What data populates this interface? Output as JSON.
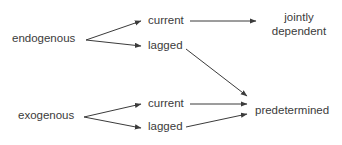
{
  "diagram": {
    "type": "flow-diagram",
    "background_color": "#ffffff",
    "ink_color": "#3b3b3b",
    "nodes": {
      "endogenous": "endogenous",
      "exogenous": "exogenous",
      "endogenous_current": "current",
      "endogenous_lagged": "lagged",
      "exogenous_current": "current",
      "exogenous_lagged": "lagged",
      "jointly_dependent": "jointly\ndependent",
      "predetermined": "predetermined"
    },
    "edges": [
      {
        "from": "endogenous",
        "to": "endogenous_current",
        "style": "arrow"
      },
      {
        "from": "endogenous",
        "to": "endogenous_lagged",
        "style": "arrow"
      },
      {
        "from": "endogenous_current",
        "to": "jointly_dependent",
        "style": "arrow"
      },
      {
        "from": "endogenous_lagged",
        "to": "predetermined",
        "style": "arrow"
      },
      {
        "from": "exogenous",
        "to": "exogenous_current",
        "style": "arrow"
      },
      {
        "from": "exogenous",
        "to": "exogenous_lagged",
        "style": "arrow"
      },
      {
        "from": "exogenous_current",
        "to": "predetermined",
        "style": "arrow"
      },
      {
        "from": "exogenous_lagged",
        "to": "predetermined",
        "style": "arrow"
      }
    ]
  }
}
